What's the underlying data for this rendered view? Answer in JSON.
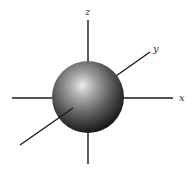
{
  "diagram": {
    "title": "",
    "axes": {
      "z": {
        "label": "z"
      },
      "y": {
        "label": "y"
      },
      "x": {
        "label": "x"
      }
    },
    "colors": {
      "axis": "#1a1a1a",
      "sphere_highlight": "#e8e8e8",
      "sphere_mid": "#7a7a7a",
      "sphere_shadow": "#111111",
      "label": "#333333"
    }
  }
}
